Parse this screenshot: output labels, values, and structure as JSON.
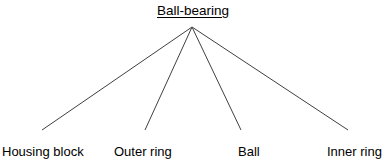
{
  "diagram": {
    "type": "hierarchy-tree",
    "background_color": "#ffffff",
    "line_color": "#404040",
    "text_color": "#000000",
    "root": {
      "label": "Ball-bearing",
      "underlined": true,
      "apex_point": {
        "x": 192,
        "y": 27
      }
    },
    "leaves": [
      {
        "label": "Housing block",
        "line_end": {
          "x": 42,
          "y": 130
        }
      },
      {
        "label": "Outer ring",
        "line_end": {
          "x": 145,
          "y": 130
        }
      },
      {
        "label": "Ball",
        "line_end": {
          "x": 241,
          "y": 130
        }
      },
      {
        "label": "Inner ring",
        "line_end": {
          "x": 348,
          "y": 130
        }
      }
    ]
  },
  "chart_data": {
    "type": "table",
    "title": "Ball-bearing",
    "categories": [
      "Housing block",
      "Outer ring",
      "Ball",
      "Inner ring"
    ],
    "values": [
      1,
      1,
      1,
      1
    ],
    "xlabel": "",
    "ylabel": ""
  }
}
